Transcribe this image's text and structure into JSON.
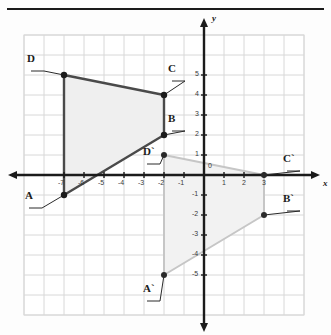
{
  "figure": {
    "title": "",
    "top_rule": true,
    "axis_labels": {
      "x": "x",
      "y": "y",
      "origin": "0"
    },
    "grid": {
      "visible": true,
      "cell_px": 20,
      "color": "#d8d8d8"
    },
    "axis_color": "#1b1b1b"
  },
  "chart_data": {
    "type": "scatter",
    "title": "",
    "xlabel": "x",
    "ylabel": "y",
    "xlim": [
      -8,
      4
    ],
    "ylim": [
      -6,
      6
    ],
    "grid": true,
    "legend": "none",
    "x_ticks": [
      -7,
      -6,
      -5,
      -4,
      -3,
      -2,
      -1,
      1,
      2,
      3
    ],
    "x_tick_labels": [
      "-7",
      "-6",
      "-5",
      "-4",
      "-3",
      "-2",
      "-1",
      "1",
      "2",
      "3"
    ],
    "y_ticks": [
      5,
      4,
      3,
      2,
      1,
      -1,
      -2,
      -3,
      -4,
      -5
    ],
    "y_tick_labels": [
      "5",
      "4",
      "3",
      "2",
      "1",
      "-1",
      "-2",
      "-3",
      "-4",
      "-5"
    ],
    "origin_label": "0",
    "series": [
      {
        "name": "ABCD",
        "kind": "polygon",
        "stroke": "#4a4a4a",
        "fill": "#efefef",
        "points": [
          {
            "label": "A",
            "x": -7,
            "y": -1
          },
          {
            "label": "B",
            "x": -2,
            "y": 2
          },
          {
            "label": "C",
            "x": -2,
            "y": 4
          },
          {
            "label": "D",
            "x": -7,
            "y": 5
          }
        ]
      },
      {
        "name": "A'B'C'D'",
        "kind": "polygon",
        "stroke": "#c6c6c6",
        "fill": "#f2f2f2",
        "points": [
          {
            "label": "A`",
            "x": -2,
            "y": -5
          },
          {
            "label": "B`",
            "x": 3,
            "y": -2
          },
          {
            "label": "C`",
            "x": 3,
            "y": 0
          },
          {
            "label": "D`",
            "x": -2,
            "y": 1
          }
        ]
      }
    ]
  },
  "point_labels": [
    {
      "text": "D",
      "lx": 27,
      "ly": 52
    },
    {
      "text": "C",
      "lx": 168,
      "ly": 62
    },
    {
      "text": "B",
      "lx": 168,
      "ly": 112
    },
    {
      "text": "A",
      "lx": 25,
      "ly": 189
    },
    {
      "text": "D`",
      "lx": 143,
      "ly": 145
    },
    {
      "text": "C`",
      "lx": 283,
      "ly": 152
    },
    {
      "text": "B`",
      "lx": 283,
      "ly": 192
    },
    {
      "text": "A`",
      "lx": 143,
      "ly": 282
    }
  ]
}
